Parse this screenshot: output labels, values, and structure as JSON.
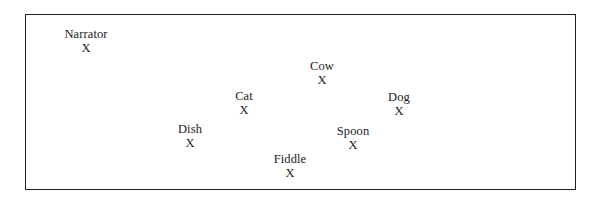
{
  "diagram": {
    "type": "stage-blocking-diagram",
    "title": "",
    "stage": {
      "border_color": "#231f20",
      "background_color": "#ffffff",
      "x": 25,
      "y": 14,
      "width": 551,
      "height": 176
    },
    "marker_symbol": "X",
    "positions": [
      {
        "label": "Narrator",
        "marker": "X",
        "x": 86,
        "y": 28
      },
      {
        "label": "Cow",
        "marker": "X",
        "x": 322,
        "y": 60
      },
      {
        "label": "Cat",
        "marker": "X",
        "x": 244,
        "y": 90
      },
      {
        "label": "Dog",
        "marker": "X",
        "x": 399,
        "y": 91
      },
      {
        "label": "Dish",
        "marker": "X",
        "x": 190,
        "y": 123
      },
      {
        "label": "Spoon",
        "marker": "X",
        "x": 353,
        "y": 125
      },
      {
        "label": "Fiddle",
        "marker": "X",
        "x": 290,
        "y": 153
      }
    ]
  }
}
